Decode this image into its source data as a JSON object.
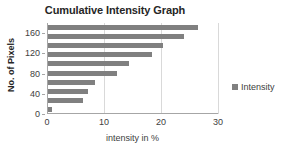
{
  "chart_data": {
    "type": "bar",
    "orientation": "horizontal",
    "title": "Cumulative Intensity Graph",
    "xlabel": "intensity in %",
    "ylabel": "No. of Pixels",
    "xlim": [
      0,
      30
    ],
    "ylim": [
      0,
      180
    ],
    "xticks": [
      0,
      10,
      20,
      30
    ],
    "xtick_labels": [
      "0",
      "10",
      "20",
      "30"
    ],
    "yticks": [
      0,
      40,
      80,
      120,
      160
    ],
    "ytick_labels": [
      "0",
      "40",
      "80",
      "120",
      "160"
    ],
    "grid": "vertical",
    "legend": {
      "position": "right",
      "entries": [
        "Intensity"
      ]
    },
    "categories": [
      180,
      160,
      140,
      120,
      100,
      80,
      60,
      40,
      20,
      0
    ],
    "series": [
      {
        "name": "Intensity",
        "color": "#808080",
        "values": [
          26.3,
          23.8,
          20.2,
          18.3,
          14.2,
          12.1,
          8.2,
          7.1,
          6.2,
          0.7
        ]
      }
    ]
  },
  "legend": {
    "swatch_color": "#808080",
    "label": "Intensity"
  }
}
